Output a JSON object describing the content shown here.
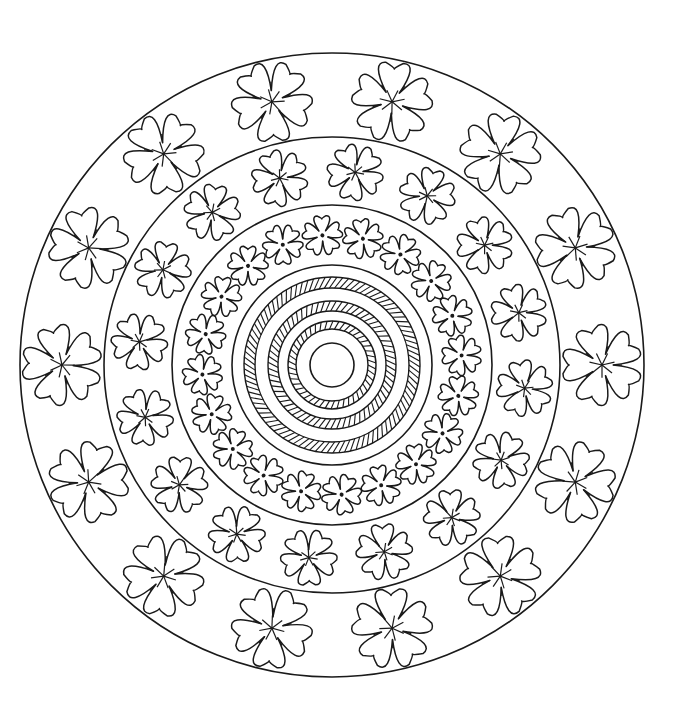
{
  "image": {
    "kind": "mandala coloring page",
    "width": 680,
    "height": 724,
    "background": "#ffffff",
    "stroke": "#1a1a1a"
  },
  "mandala": {
    "center": [
      332,
      365
    ],
    "rings": [
      {
        "name": "outer-flower-ring",
        "r_outer": 312,
        "r_inner": 228,
        "flower_count": 14,
        "flower_size": 40,
        "motif": "large five-petal flower with star center"
      },
      {
        "name": "middle-flower-ring",
        "r_outer": 228,
        "r_inner": 160,
        "flower_count": 16,
        "flower_size": 28,
        "motif": "medium flower with star center"
      },
      {
        "name": "inner-flower-ring",
        "r_outer": 160,
        "r_inner": 100,
        "flower_count": 20,
        "flower_size": 20,
        "motif": "small flower with dot center"
      }
    ],
    "rope_bands": [
      {
        "r_outer": 88,
        "r_inner": 77
      },
      {
        "r_outer": 64,
        "r_inner": 54
      },
      {
        "r_outer": 44,
        "r_inner": 36
      }
    ],
    "center_circle_r": 22
  }
}
